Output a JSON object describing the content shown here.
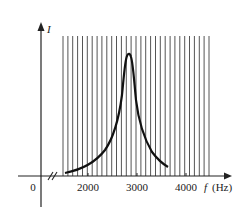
{
  "chart_data": {
    "type": "line",
    "title": "",
    "xlabel": "f (Hz)",
    "ylabel": "I",
    "origin_label": "0",
    "x_ticks": [
      2000,
      3000,
      4000
    ],
    "x_tick_labels": [
      "2000",
      "3000",
      "4000"
    ],
    "axis_break": "//",
    "grid": "dense vertical lines from ~1450 Hz to ~4400 Hz",
    "resonance_frequency_hz": 2800,
    "series": [
      {
        "name": "I",
        "x": [
          1550,
          1800,
          2000,
          2200,
          2400,
          2550,
          2650,
          2720,
          2760,
          2790,
          2800,
          2810,
          2840,
          2880,
          2950,
          3050,
          3200,
          3400,
          3650
        ],
        "y_relative": [
          0.02,
          0.07,
          0.12,
          0.19,
          0.3,
          0.42,
          0.56,
          0.72,
          0.85,
          0.95,
          1.0,
          0.96,
          0.86,
          0.7,
          0.52,
          0.36,
          0.22,
          0.12,
          0.06
        ]
      }
    ],
    "xlim": [
      0,
      4600
    ],
    "ylim": [
      0,
      1.2
    ]
  },
  "labels": {
    "y_axis": "I",
    "x_axis_f": "f",
    "x_axis_unit": "(Hz)",
    "origin": "0",
    "tick_2000": "2000",
    "tick_3000": "3000",
    "tick_4000": "4000"
  }
}
